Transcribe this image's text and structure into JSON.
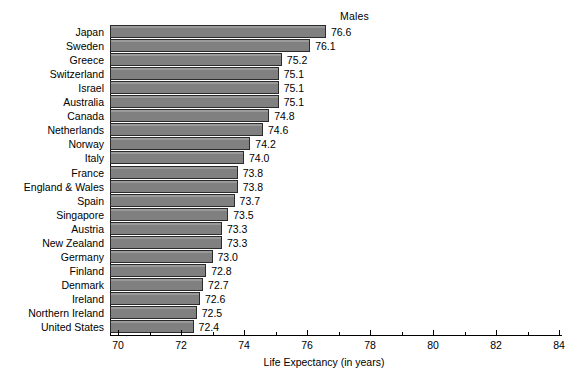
{
  "chart_data": {
    "type": "bar",
    "orientation": "horizontal",
    "title": "Males",
    "xlabel": "Life Expectancy (in years)",
    "ylabel": "",
    "xlim": [
      70,
      84
    ],
    "xticks": [
      70,
      72,
      74,
      76,
      78,
      80,
      82,
      84
    ],
    "xtick_labels": [
      "70",
      "72",
      "74",
      "76",
      "78",
      "80",
      "82",
      "84"
    ],
    "xminor_ticks": [
      71,
      73,
      75,
      77,
      79,
      81,
      83
    ],
    "grid": false,
    "legend": "none",
    "bar_color": "#808080",
    "bar_edge_color": "#2b2b2b",
    "show_value_labels": true,
    "categories": [
      "Japan",
      "Sweden",
      "Greece",
      "Switzerland",
      "Israel",
      "Australia",
      "Canada",
      "Netherlands",
      "Norway",
      "Italy",
      "France",
      "England & Wales",
      "Spain",
      "Singapore",
      "Austria",
      "New Zealand",
      "Germany",
      "Finland",
      "Denmark",
      "Ireland",
      "Northern Ireland",
      "United States"
    ],
    "values": [
      76.6,
      76.1,
      75.2,
      75.1,
      75.1,
      75.1,
      74.8,
      74.6,
      74.2,
      74.0,
      73.8,
      73.8,
      73.7,
      73.5,
      73.3,
      73.3,
      73.0,
      72.8,
      72.7,
      72.6,
      72.5,
      72.4
    ],
    "value_labels": [
      "76.6",
      "76.1",
      "75.2",
      "75.1",
      "75.1",
      "75.1",
      "74.8",
      "74.6",
      "74.2",
      "74.0",
      "73.8",
      "73.8",
      "73.7",
      "73.5",
      "73.3",
      "73.3",
      "73.0",
      "72.8",
      "72.7",
      "72.6",
      "72.5",
      "72.4"
    ]
  }
}
